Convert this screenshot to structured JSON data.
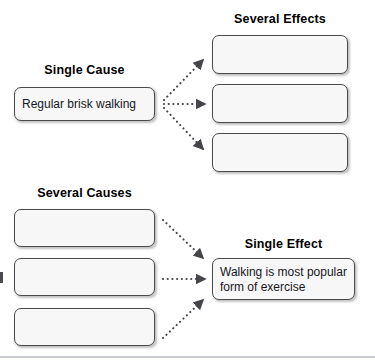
{
  "diagram": {
    "colors": {
      "box_fill": "#f7f7f8",
      "box_border": "#4a4a4d",
      "arrow": "#45454a",
      "text": "#16161a",
      "heading": "#000000",
      "footer_rule": "#c9cdd2"
    },
    "sections": [
      {
        "id": "single-cause-several-effects",
        "cause_heading": "Single Cause",
        "effect_heading": "Several Effects",
        "cause_boxes": [
          {
            "text": "Regular brisk walking",
            "empty": false
          }
        ],
        "effect_boxes": [
          {
            "text": "",
            "empty": true
          },
          {
            "text": "",
            "empty": true
          },
          {
            "text": "",
            "empty": true
          }
        ],
        "arrow_count": 3,
        "arrow_style": "dotted"
      },
      {
        "id": "several-causes-single-effect",
        "cause_heading": "Several Causes",
        "effect_heading": "Single Effect",
        "cause_boxes": [
          {
            "text": "",
            "empty": true
          },
          {
            "text": "",
            "empty": true
          },
          {
            "text": "",
            "empty": true
          }
        ],
        "effect_boxes": [
          {
            "text": "Walking is most popular form of exercise",
            "empty": false
          }
        ],
        "arrow_count": 3,
        "arrow_style": "dotted"
      }
    ],
    "icons": {
      "arrow": "dotted-arrow-icon"
    }
  }
}
